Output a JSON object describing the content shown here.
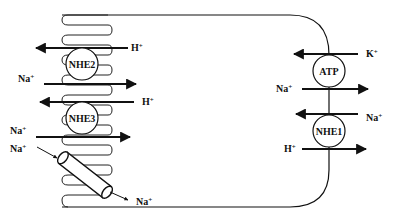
{
  "diagram": {
    "type": "epithelial-cell-ion-transport",
    "colors": {
      "line": "#111111",
      "background": "#ffffff"
    },
    "apical": {
      "transporters": [
        {
          "name": "NHE2",
          "label": "NHE2",
          "arrows": [
            {
              "ion": "H",
              "charge": "+",
              "direction": "out"
            },
            {
              "ion": "Na",
              "charge": "+",
              "direction": "in"
            }
          ]
        },
        {
          "name": "NHE3",
          "label": "NHE3",
          "arrows": [
            {
              "ion": "H",
              "charge": "+",
              "direction": "out"
            },
            {
              "ion": "Na",
              "charge": "+",
              "direction": "in"
            }
          ]
        }
      ],
      "channel": {
        "name": "sodium-channel",
        "in_ion": "Na",
        "in_charge": "+",
        "out_ion": "Na",
        "out_charge": "+"
      }
    },
    "basolateral": {
      "transporters": [
        {
          "name": "Na-K-ATPase",
          "label": "ATP",
          "arrows": [
            {
              "ion": "K",
              "charge": "+",
              "direction": "in"
            },
            {
              "ion": "Na",
              "charge": "+",
              "direction": "out"
            }
          ]
        },
        {
          "name": "NHE1",
          "label": "NHE1",
          "arrows": [
            {
              "ion": "Na",
              "charge": "+",
              "direction": "in"
            },
            {
              "ion": "H",
              "charge": "+",
              "direction": "out"
            }
          ]
        }
      ]
    }
  }
}
